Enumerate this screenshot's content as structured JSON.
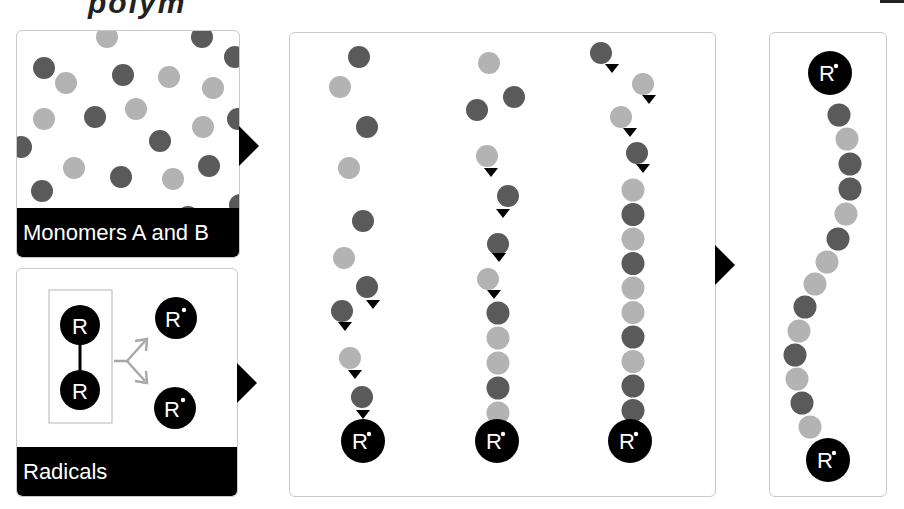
{
  "colors": {
    "monomer_a": "#5a5a5a",
    "monomer_b": "#b3b3b3",
    "radical": "#000000",
    "panel_border": "#c9c9c9",
    "label_bar": "#000000",
    "split_arrow": "#a8a8a8"
  },
  "title_fragment": "polym",
  "panels": {
    "monomers": {
      "label": "Monomers A and B",
      "dots": [
        {
          "x": 90,
          "y": 6,
          "t": "b"
        },
        {
          "x": 185,
          "y": 6,
          "t": "a"
        },
        {
          "x": 218,
          "y": 26,
          "t": "a"
        },
        {
          "x": 27,
          "y": 37,
          "t": "a"
        },
        {
          "x": 49,
          "y": 52,
          "t": "b"
        },
        {
          "x": 106,
          "y": 44,
          "t": "a"
        },
        {
          "x": 152,
          "y": 46,
          "t": "b"
        },
        {
          "x": 196,
          "y": 57,
          "t": "b"
        },
        {
          "x": 27,
          "y": 88,
          "t": "b"
        },
        {
          "x": 78,
          "y": 86,
          "t": "a"
        },
        {
          "x": 119,
          "y": 78,
          "t": "b"
        },
        {
          "x": 221,
          "y": 88,
          "t": "a"
        },
        {
          "x": 186,
          "y": 96,
          "t": "b"
        },
        {
          "x": 4,
          "y": 116,
          "t": "a"
        },
        {
          "x": 143,
          "y": 110,
          "t": "a"
        },
        {
          "x": 57,
          "y": 137,
          "t": "b"
        },
        {
          "x": 104,
          "y": 146,
          "t": "a"
        },
        {
          "x": 156,
          "y": 148,
          "t": "b"
        },
        {
          "x": 192,
          "y": 135,
          "t": "a"
        },
        {
          "x": 25,
          "y": 160,
          "t": "a"
        },
        {
          "x": 223,
          "y": 174,
          "t": "a"
        },
        {
          "x": 42,
          "y": 188,
          "t": "b"
        },
        {
          "x": 124,
          "y": 188,
          "t": "b"
        },
        {
          "x": 171,
          "y": 186,
          "t": "a"
        }
      ]
    },
    "radicals": {
      "label": "Radicals",
      "initiator_symbol": "R",
      "radical_symbol": "R",
      "radical_dot": "•"
    },
    "propagation": {
      "chains": [
        {
          "name": "chain-1",
          "free": [
            {
              "x": 69,
              "y": 24,
              "t": "a"
            },
            {
              "x": 50,
              "y": 54,
              "t": "b"
            },
            {
              "x": 77,
              "y": 94,
              "t": "a"
            },
            {
              "x": 59,
              "y": 135,
              "t": "b"
            },
            {
              "x": 73,
              "y": 188,
              "t": "a"
            },
            {
              "x": 54,
              "y": 225,
              "t": "b"
            }
          ],
          "attaching": [
            {
              "x": 77,
              "y": 254,
              "t": "a",
              "ax": 83,
              "ay": 272
            },
            {
              "x": 52,
              "y": 278,
              "t": "a",
              "ax": 55,
              "ay": 294
            },
            {
              "x": 60,
              "y": 325,
              "t": "b",
              "ax": 65,
              "ay": 342
            },
            {
              "x": 72,
              "y": 364,
              "t": "a",
              "ax": 73,
              "ay": 382
            }
          ],
          "radical": {
            "x": 73,
            "y": 408
          }
        },
        {
          "name": "chain-2",
          "free": [
            {
              "x": 199,
              "y": 30,
              "t": "b"
            },
            {
              "x": 224,
              "y": 64,
              "t": "a"
            },
            {
              "x": 187,
              "y": 77,
              "t": "a"
            }
          ],
          "attaching": [
            {
              "x": 197,
              "y": 123,
              "t": "b",
              "ax": 201,
              "ay": 140
            },
            {
              "x": 218,
              "y": 163,
              "t": "a",
              "ax": 213,
              "ay": 181
            },
            {
              "x": 208,
              "y": 211,
              "t": "a",
              "ax": 209,
              "ay": 225
            },
            {
              "x": 198,
              "y": 246,
              "t": "b",
              "ax": 204,
              "ay": 262
            }
          ],
          "stack": [
            "a",
            "b",
            "b",
            "a",
            "b"
          ],
          "stack_x": 208,
          "stack_y0": 280,
          "stack_dy": 25,
          "radical": {
            "x": 207,
            "y": 408
          }
        },
        {
          "name": "chain-3",
          "free": [],
          "attaching": [
            {
              "x": 311,
              "y": 20,
              "t": "a",
              "ax": 322,
              "ay": 36
            },
            {
              "x": 353,
              "y": 51,
              "t": "b",
              "ax": 359,
              "ay": 67
            },
            {
              "x": 331,
              "y": 84,
              "t": "b",
              "ax": 340,
              "ay": 100
            },
            {
              "x": 347,
              "y": 120,
              "t": "a",
              "ax": 353,
              "ay": 136
            }
          ],
          "stack": [
            "b",
            "a",
            "b",
            "a",
            "b",
            "b",
            "a",
            "b",
            "a",
            "a"
          ],
          "stack_x": 343,
          "stack_y0": 157,
          "stack_dy": 24.5,
          "radical": {
            "x": 340,
            "y": 408
          }
        }
      ]
    },
    "polymer": {
      "top_radical": {
        "x": 60,
        "y": 40
      },
      "beads": [
        {
          "x": 69,
          "y": 82,
          "t": "a"
        },
        {
          "x": 77,
          "y": 106,
          "t": "b"
        },
        {
          "x": 80,
          "y": 131,
          "t": "a"
        },
        {
          "x": 80,
          "y": 156,
          "t": "a"
        },
        {
          "x": 76,
          "y": 181,
          "t": "b"
        },
        {
          "x": 68,
          "y": 206,
          "t": "a"
        },
        {
          "x": 57,
          "y": 229,
          "t": "b"
        },
        {
          "x": 45,
          "y": 251,
          "t": "b"
        },
        {
          "x": 35,
          "y": 274,
          "t": "a"
        },
        {
          "x": 29,
          "y": 298,
          "t": "b"
        },
        {
          "x": 25,
          "y": 322,
          "t": "a"
        },
        {
          "x": 27,
          "y": 346,
          "t": "b"
        },
        {
          "x": 32,
          "y": 370,
          "t": "a"
        },
        {
          "x": 40,
          "y": 394,
          "t": "b"
        }
      ],
      "bottom_radical": {
        "x": 58,
        "y": 427
      }
    }
  }
}
